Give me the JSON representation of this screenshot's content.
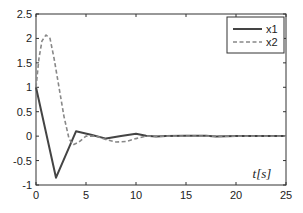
{
  "chart_data": {
    "type": "line",
    "title": "",
    "xlabel": "t[s]",
    "ylabel": "",
    "xlim": [
      0,
      25
    ],
    "ylim": [
      -1,
      2.5
    ],
    "grid": false,
    "legend_position": "upper right",
    "x_ticks": [
      0,
      5,
      10,
      15,
      20,
      25
    ],
    "x_tick_labels": [
      "0",
      "5",
      "10",
      "15",
      "20",
      "25"
    ],
    "y_ticks": [
      -1,
      -0.5,
      0,
      0.5,
      1,
      1.5,
      2,
      2.5
    ],
    "y_tick_labels": [
      "-1",
      "-0.5",
      "0",
      "0.5",
      "1",
      "1.5",
      "2",
      "2.5"
    ],
    "series": [
      {
        "name": "x1",
        "style": "solid",
        "color": "#444444",
        "x": [
          0,
          2,
          4,
          5.5,
          7,
          8.5,
          10,
          11,
          12,
          13,
          15,
          17,
          18,
          20,
          25
        ],
        "y": [
          1.0,
          -0.85,
          0.1,
          0.03,
          -0.05,
          0.0,
          0.05,
          0.01,
          -0.01,
          0.0,
          0.01,
          0.01,
          -0.01,
          0.0,
          0.0
        ]
      },
      {
        "name": "x2",
        "style": "dashed",
        "color": "#888888",
        "x": [
          0,
          0.3,
          0.6,
          1.0,
          1.4,
          1.8,
          2.3,
          2.8,
          3.3,
          3.7,
          4.3,
          5.0,
          6.0,
          7.0,
          8.0,
          9.0,
          10.0,
          11.0,
          12.0,
          15.0,
          20.0,
          25.0
        ],
        "y": [
          1.0,
          1.6,
          1.95,
          2.07,
          2.0,
          1.6,
          1.0,
          0.4,
          -0.05,
          -0.18,
          -0.12,
          0.0,
          0.0,
          -0.07,
          -0.12,
          -0.11,
          -0.05,
          0.0,
          0.0,
          0.0,
          0.0,
          0.0
        ]
      }
    ],
    "legend": [
      {
        "label": "x1",
        "style": "solid"
      },
      {
        "label": "x2",
        "style": "dashed"
      }
    ]
  }
}
